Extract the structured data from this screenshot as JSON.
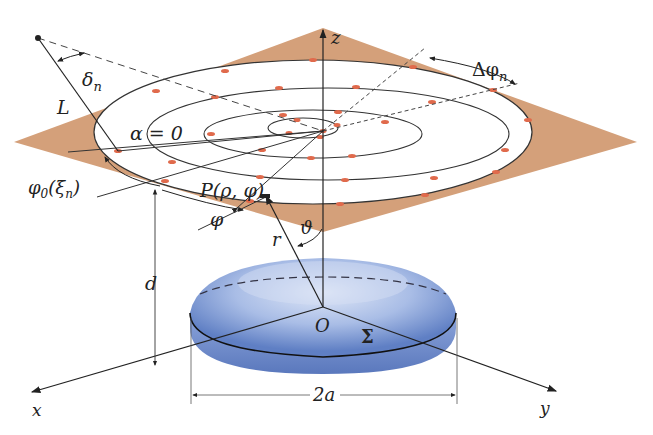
{
  "figure": {
    "type": "3d-geometry-diagram"
  },
  "colors": {
    "plane_fill": "#d4a07a",
    "ring_fill": "#ffffff",
    "source_dot": "#e06a4c",
    "disk_light": "#c9d6f0",
    "disk_dark": "#5f7fc4",
    "line": "#222222"
  },
  "labels": {
    "z_axis": "z",
    "x_axis": "x",
    "y_axis": "y",
    "origin": "O",
    "surface": "Σ",
    "diameter": "2a",
    "height": "d",
    "radius_vector": "r",
    "polar_angle": "ϑ",
    "point": "P(ρ, φ)",
    "azimuth": "φ",
    "alpha_zero": "α = 0",
    "initial_angle": "φ0(ξn)",
    "initial_angle_base": "φ",
    "initial_angle_sub": "0",
    "initial_angle_arg": "(ξ",
    "initial_angle_arg_sub": "n",
    "initial_angle_close": ")",
    "line_L": "L",
    "delta_n": "δ",
    "delta_sub": "n",
    "delta_phi": "Δφ",
    "delta_phi_sub": "n"
  },
  "rings": [
    {
      "name": "ring-1",
      "rx": 219,
      "ry": 72,
      "sources": 16
    },
    {
      "name": "ring-2",
      "rx": 181,
      "ry": 46,
      "sources": 12
    },
    {
      "name": "ring-3",
      "rx": 109,
      "ry": 24,
      "sources": 8
    },
    {
      "name": "ring-4",
      "rx": 35,
      "ry": 10,
      "sources": 4
    }
  ]
}
